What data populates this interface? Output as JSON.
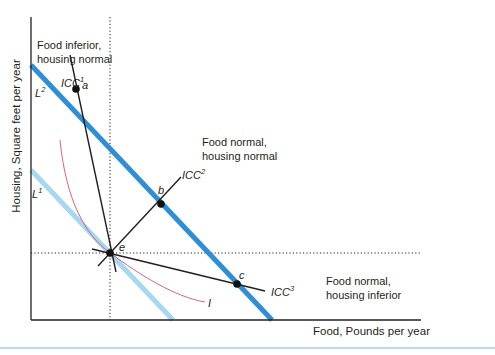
{
  "axes": {
    "y_label": "Housing, Square feet per year",
    "x_label": "Food, Pounds per year"
  },
  "regions": {
    "top_left": [
      "Food inferior,",
      "housing normal"
    ],
    "top_right": [
      "Food normal,",
      "housing normal"
    ],
    "bottom_right": [
      "Food normal,",
      "housing inferior"
    ]
  },
  "budget_lines": [
    {
      "name": "L",
      "sup": "1",
      "color": "#a6d8f0"
    },
    {
      "name": "L",
      "sup": "2",
      "color": "#2e8fd6"
    }
  ],
  "income_consumption_curves": [
    {
      "name": "ICC",
      "sup": "1"
    },
    {
      "name": "ICC",
      "sup": "2"
    },
    {
      "name": "ICC",
      "sup": "3"
    }
  ],
  "points": {
    "a": "a",
    "b": "b",
    "c": "c",
    "e": "e"
  },
  "indifference_curve": {
    "label": "I",
    "color": "#d9637a"
  },
  "colors": {
    "axis": "#231f20",
    "rule": "#9fd3ee"
  }
}
